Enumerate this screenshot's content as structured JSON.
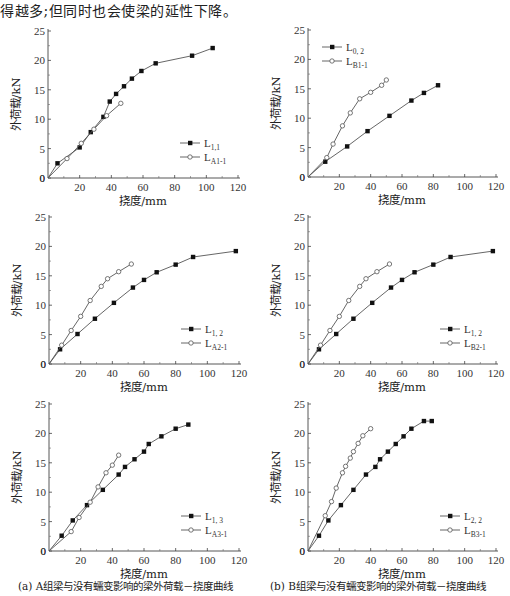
{
  "intro_text": "得越多;但同时也会使梁的延性下降。",
  "captions": {
    "a": "(a) A组梁与没有蠕变影响的梁外荷载－挠度曲线",
    "b": "(b) B组梁与没有蠕变影响的梁外荷载－挠度曲线"
  },
  "chart_data": [
    {
      "id": "a1",
      "type": "line",
      "xlabel": "挠度/mm",
      "ylabel": "外荷载/kN",
      "xlim": [
        0,
        120
      ],
      "ylim": [
        0,
        25
      ],
      "xticks": [
        20,
        40,
        60,
        80,
        100,
        120
      ],
      "yticks": [
        0,
        5,
        10,
        15,
        20,
        25
      ],
      "grid": false,
      "legend_position": "lower right",
      "series": [
        {
          "name": "L",
          "sub": "1,1",
          "marker": "filled-square",
          "x": [
            0,
            6,
            20,
            27,
            35,
            39,
            43,
            48,
            53,
            59,
            68,
            91,
            104
          ],
          "y": [
            0,
            2.5,
            5.2,
            7.8,
            10.4,
            13.0,
            14.3,
            15.6,
            16.9,
            18.2,
            19.5,
            20.8,
            22.1
          ]
        },
        {
          "name": "L",
          "sub": "A1-1",
          "marker": "open-circle",
          "x": [
            0,
            12,
            21,
            29,
            37,
            46
          ],
          "y": [
            0,
            3.3,
            5.9,
            8.3,
            10.6,
            12.7
          ]
        }
      ]
    },
    {
      "id": "b1",
      "type": "line",
      "xlabel": "挠度/mm",
      "ylabel": "外荷载/kN",
      "xlim": [
        0,
        120
      ],
      "ylim": [
        0,
        25
      ],
      "xticks": [
        20,
        40,
        60,
        80,
        100,
        120
      ],
      "yticks": [
        0,
        5,
        10,
        15,
        20,
        25
      ],
      "grid": false,
      "legend_position": "upper left",
      "series": [
        {
          "name": "L",
          "sub": "0, 2",
          "marker": "filled-square",
          "x": [
            0,
            11,
            25,
            38,
            52,
            66,
            74,
            83
          ],
          "y": [
            0,
            2.6,
            5.2,
            7.8,
            10.4,
            13.0,
            14.3,
            15.6
          ]
        },
        {
          "name": "L",
          "sub": "B1-1",
          "marker": "open-circle",
          "x": [
            0,
            12,
            16,
            22,
            27,
            33,
            40,
            47,
            50
          ],
          "y": [
            0,
            3.3,
            5.6,
            8.7,
            10.9,
            13.3,
            14.4,
            15.6,
            16.5
          ]
        }
      ]
    },
    {
      "id": "a2",
      "type": "line",
      "xlabel": "挠度/mm",
      "ylabel": "外荷载/kN",
      "xlim": [
        0,
        120
      ],
      "ylim": [
        0,
        25
      ],
      "xticks": [
        20,
        40,
        60,
        80,
        100,
        120
      ],
      "yticks": [
        0,
        5,
        10,
        15,
        20,
        25
      ],
      "grid": false,
      "legend_position": "lower right",
      "series": [
        {
          "name": "L",
          "sub": "1, 2",
          "marker": "filled-square",
          "x": [
            0,
            7,
            18,
            29,
            41,
            53,
            60,
            68,
            80,
            91,
            118
          ],
          "y": [
            0,
            2.5,
            5.1,
            7.7,
            10.4,
            13.0,
            14.3,
            15.6,
            16.9,
            18.2,
            19.2
          ]
        },
        {
          "name": "L",
          "sub": "A2-1",
          "marker": "open-circle",
          "x": [
            0,
            8,
            14,
            20,
            26,
            33,
            37,
            44,
            52
          ],
          "y": [
            0,
            3.2,
            5.7,
            8.1,
            10.8,
            13.2,
            14.5,
            15.7,
            17.0
          ]
        }
      ]
    },
    {
      "id": "b2",
      "type": "line",
      "xlabel": "挠度/mm",
      "ylabel": "外荷载/kN",
      "xlim": [
        0,
        120
      ],
      "ylim": [
        0,
        25
      ],
      "xticks": [
        20,
        40,
        60,
        80,
        100,
        120
      ],
      "yticks": [
        0,
        5,
        10,
        15,
        20,
        25
      ],
      "grid": false,
      "legend_position": "lower right",
      "series": [
        {
          "name": "L",
          "sub": "1, 2",
          "marker": "filled-square",
          "x": [
            0,
            7,
            18,
            29,
            41,
            53,
            60,
            68,
            80,
            91,
            118
          ],
          "y": [
            0,
            2.5,
            5.1,
            7.7,
            10.4,
            13.0,
            14.3,
            15.6,
            16.9,
            18.2,
            19.2
          ]
        },
        {
          "name": "L",
          "sub": "B2-1",
          "marker": "open-circle",
          "x": [
            0,
            8,
            14,
            20,
            26,
            33,
            37,
            44,
            52
          ],
          "y": [
            0,
            3.2,
            5.7,
            8.1,
            10.8,
            13.2,
            14.5,
            15.7,
            17.0
          ]
        }
      ]
    },
    {
      "id": "a3",
      "type": "line",
      "xlabel": "挠度/mm",
      "ylabel": "外荷载/kN",
      "xlim": [
        0,
        120
      ],
      "ylim": [
        0,
        25
      ],
      "xticks": [
        20,
        40,
        60,
        80,
        100,
        120
      ],
      "yticks": [
        0,
        5,
        10,
        15,
        20,
        25
      ],
      "grid": false,
      "legend_position": "lower right",
      "series": [
        {
          "name": "L",
          "sub": "1, 3",
          "marker": "filled-square",
          "x": [
            0,
            8,
            15,
            24,
            34,
            44,
            48,
            54,
            60,
            63,
            71,
            80,
            88
          ],
          "y": [
            0,
            2.6,
            5.2,
            7.8,
            10.4,
            13.0,
            14.3,
            15.6,
            16.9,
            18.2,
            19.5,
            20.8,
            21.5
          ]
        },
        {
          "name": "L",
          "sub": "A3-1",
          "marker": "open-circle",
          "x": [
            0,
            14,
            19,
            26,
            31,
            36,
            40,
            44
          ],
          "y": [
            0,
            3.3,
            5.7,
            8.3,
            10.9,
            13.3,
            14.6,
            16.3
          ]
        }
      ]
    },
    {
      "id": "b3",
      "type": "line",
      "xlabel": "挠度/mm",
      "ylabel": "外荷载/kN",
      "xlim": [
        0,
        120
      ],
      "ylim": [
        0,
        25
      ],
      "xticks": [
        20,
        40,
        60,
        80,
        100,
        120
      ],
      "yticks": [
        0,
        5,
        10,
        15,
        20,
        25
      ],
      "grid": false,
      "legend_position": "lower right",
      "series": [
        {
          "name": "L",
          "sub": "2, 2",
          "marker": "filled-square",
          "x": [
            0,
            7,
            13,
            21,
            29,
            37,
            43,
            46,
            51,
            56,
            61,
            66,
            74,
            79
          ],
          "y": [
            0,
            2.6,
            5.2,
            7.8,
            10.4,
            13.0,
            14.3,
            15.6,
            16.9,
            18.2,
            19.5,
            20.8,
            22.1,
            22.1
          ]
        },
        {
          "name": "L",
          "sub": "B3-1",
          "marker": "open-circle",
          "x": [
            0,
            11,
            15,
            18,
            22,
            24,
            27,
            29,
            32,
            35,
            40
          ],
          "y": [
            0,
            6.0,
            8.4,
            10.7,
            13.3,
            14.4,
            15.8,
            16.9,
            18.3,
            19.6,
            20.8
          ]
        }
      ]
    }
  ]
}
